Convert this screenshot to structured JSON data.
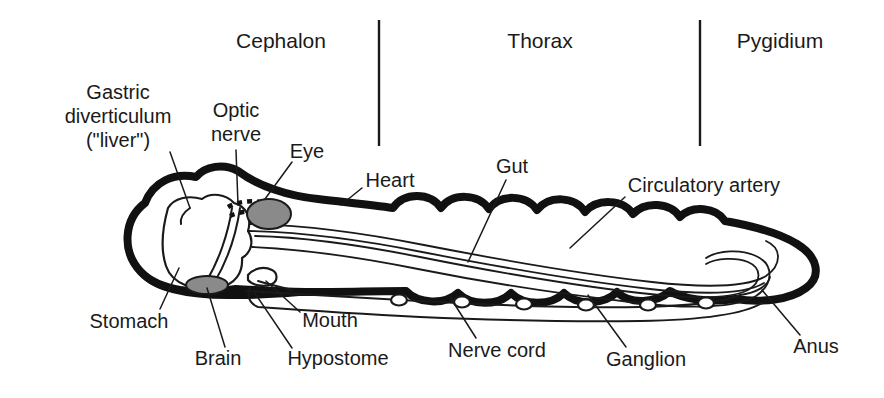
{
  "figure": {
    "background_color": "#ffffff",
    "ink_color": "#1a1a1a",
    "organ_fill_color": "#8a8a8a"
  },
  "regions": [
    {
      "id": "cephalon",
      "label": "Cephalon",
      "x": 281,
      "y": 42
    },
    {
      "id": "thorax",
      "label": "Thorax",
      "x": 540,
      "y": 42
    },
    {
      "id": "pygidium",
      "label": "Pygidium",
      "x": 780,
      "y": 42
    }
  ],
  "dividers": [
    {
      "id": "cephalon-thorax",
      "x": 379,
      "y1": 20,
      "y2": 146
    },
    {
      "id": "thorax-pygidium",
      "x": 700,
      "y1": 20,
      "y2": 146
    }
  ],
  "parts": [
    {
      "id": "gastric-diverticulum",
      "label_lines": [
        "Gastric",
        "diverticulum",
        "(\"liver\")"
      ],
      "label_x": 118,
      "label_y": 118,
      "align": "mid",
      "leader": "M 170,152 L 190,208"
    },
    {
      "id": "optic-nerve",
      "label_lines": [
        "Optic",
        "nerve"
      ],
      "label_x": 236,
      "label_y": 124,
      "align": "mid",
      "leader": "M 236,150 L 238,205"
    },
    {
      "id": "eye",
      "label_lines": [
        "Eye"
      ],
      "label_x": 307,
      "label_y": 153,
      "align": "mid",
      "leader": "M 292,162 L 265,199"
    },
    {
      "id": "heart",
      "label_lines": [
        "Heart"
      ],
      "label_x": 390,
      "label_y": 182,
      "align": "mid",
      "leader": "M 362,188 L 341,205"
    },
    {
      "id": "gut",
      "label_lines": [
        "Gut"
      ],
      "label_x": 512,
      "label_y": 168,
      "align": "mid",
      "leader": "M 506,180 L 468,262"
    },
    {
      "id": "circulatory-artery",
      "label_lines": [
        "Circulatory artery"
      ],
      "label_x": 704,
      "label_y": 187,
      "align": "mid",
      "leader": "M 625,197 L 570,248"
    },
    {
      "id": "stomach",
      "label_lines": [
        "Stomach"
      ],
      "label_x": 129,
      "label_y": 323,
      "align": "mid",
      "leader": "M 160,309 L 179,268"
    },
    {
      "id": "brain",
      "label_lines": [
        "Brain"
      ],
      "label_x": 218,
      "label_y": 360,
      "align": "mid",
      "leader": "M 225,347 L 207,288"
    },
    {
      "id": "hypostome",
      "label_lines": [
        "Hypostome"
      ],
      "label_x": 338,
      "label_y": 360,
      "align": "mid",
      "leader": "M 292,348 L 254,292"
    },
    {
      "id": "mouth",
      "label_lines": [
        "Mouth"
      ],
      "label_x": 330,
      "label_y": 322,
      "align": "mid",
      "leader": "M 300,312 L 266,281"
    },
    {
      "id": "nerve-cord",
      "label_lines": [
        "Nerve cord"
      ],
      "label_x": 497,
      "label_y": 352,
      "align": "mid",
      "leader": "M 476,338 L 450,297"
    },
    {
      "id": "ganglion",
      "label_lines": [
        "Ganglion"
      ],
      "label_x": 646,
      "label_y": 361,
      "align": "mid",
      "leader": "M 626,347 L 588,295"
    },
    {
      "id": "anus",
      "label_lines": [
        "Anus"
      ],
      "label_x": 816,
      "label_y": 348,
      "align": "mid",
      "leader": "M 800,335 L 762,290"
    }
  ],
  "anatomy": {
    "shell_outer": "M 236,289 C 196,296 158,290 141,272 C 121,251 124,219 145,203 C 153,182 174,172 196,177 C 205,166 224,163 238,171 C 258,186 288,196 318,199 C 352,203 372,205 393,208 C 404,192 430,192 441,208 C 452,193 478,193 489,209 C 500,194 526,194 537,210 C 549,195 575,196 585,212 C 597,198 623,199 633,214 C 645,201 670,202 680,217 C 692,205 716,207 725,221 C 742,224 776,231 797,244 C 818,257 822,276 806,288 C 790,300 762,303 735,299 C 708,303 683,299 670,291 C 657,303 630,305 617,292 C 604,305 577,306 564,293 C 551,306 524,306 511,293 C 498,306 471,306 458,293 C 445,305 418,304 406,291 C 380,291 342,292 310,292 C 285,292 258,290 236,289 Z",
    "cephalon_top": "M 145,203 C 153,182 174,172 196,177 C 205,166 224,163 238,171 C 258,186 288,196 318,199",
    "stomach": "M 168,208 C 163,226 160,248 166,266 C 172,284 195,292 217,288 C 236,285 243,272 242,258 C 252,252 254,240 248,231 C 252,218 246,206 234,203 C 226,194 211,192 202,199 C 188,195 174,198 168,208 Z",
    "gastric_diverticulum": "M 190,208 C 184,212 180,218 181,224",
    "brain": {
      "cx": 207,
      "cy": 285,
      "rx": 21,
      "ry": 9
    },
    "eye": {
      "cx": 269,
      "cy": 214,
      "rx": 22,
      "ry": 15
    },
    "optic_nerve_band": "M 228,207 C 240,200 258,200 272,204",
    "optic_nerve_band2": "M 230,216 C 242,210 260,210 274,213",
    "optic_nerve_stalk": "M 232,208 C 228,235 218,262 207,280",
    "optic_nerve_stalk2": "M 240,208 C 236,236 226,263 214,283",
    "gut": "M 255,236 C 300,237 360,245 420,257 C 490,271 570,285 640,293 C 690,299 730,299 748,290 C 762,282 762,268 748,262 C 736,257 716,258 706,264",
    "gut_lower": "M 252,247 C 298,249 358,257 418,269 C 488,283 568,295 638,303 C 690,309 736,308 756,296 C 774,284 774,264 756,256 C 742,249 718,250 706,258",
    "artery": "M 250,224 C 300,225 364,233 424,245 C 496,259 580,274 652,282 C 706,288 748,287 766,276 C 782,265 782,248 766,241",
    "artery_lower": "M 248,231 C 298,232 362,240 422,252 C 494,266 578,281 650,289 C 704,295 746,294 764,283",
    "hypostome": "M 248,275 C 254,268 264,266 272,270 C 278,273 278,281 272,284 C 264,288 252,285 248,280 Z",
    "mouth_line": "M 258,281 C 268,284 280,287 292,290",
    "nerve_cord": "M 246,291 C 300,294 360,298 420,301 C 490,305 570,308 640,307 C 690,306 724,302 740,295",
    "ganglia": [
      {
        "cx": 399,
        "cy": 300,
        "r": 5.5
      },
      {
        "cx": 462,
        "cy": 302,
        "r": 5.5
      },
      {
        "cx": 524,
        "cy": 304,
        "r": 5.5
      },
      {
        "cx": 586,
        "cy": 305,
        "r": 5.5
      },
      {
        "cx": 648,
        "cy": 305,
        "r": 5.5
      },
      {
        "cx": 706,
        "cy": 303,
        "r": 5.5
      }
    ],
    "body_lower_inner": "M 250,288 C 246,296 250,304 258,307 C 300,310 360,314 420,317 C 490,320 570,322 640,321 C 700,320 744,314 762,303",
    "pygidium_inner": "M 740,295 C 756,293 768,286 770,277",
    "cephalon_lower_rim": "M 141,272 C 152,288 186,297 236,296 C 266,296 292,294 310,292"
  }
}
